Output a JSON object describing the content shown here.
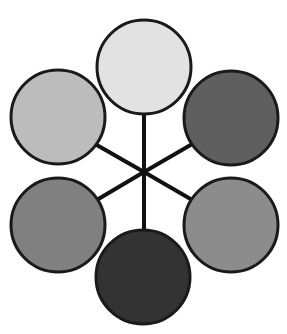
{
  "figure": {
    "width": 287,
    "height": 334,
    "background_color": "#ffffff"
  },
  "chart_data": {
    "type": "scatter",
    "subtitle": "",
    "xlabel": "",
    "ylabel": "",
    "grid": false,
    "legend_position": "none",
    "xlim": [
      0,
      287
    ],
    "ylim": [
      0,
      334
    ],
    "layout": "hexagonal rosette around a central hub",
    "hub": {
      "name": "center-hub",
      "x": 144,
      "y": 172,
      "visible_marker": false
    },
    "node_radius": 47,
    "node_outline_color": "#1a1a1a",
    "node_outline_width": 3,
    "spoke_color": "#111111",
    "spoke_width": 4,
    "categories": [
      "top",
      "upper-right",
      "lower-right",
      "bottom",
      "lower-left",
      "upper-left"
    ],
    "values": [
      226,
      95,
      140,
      51,
      128,
      188
    ],
    "series": [
      {
        "name": "node-fill-gray-level",
        "values": [
          226,
          95,
          140,
          51,
          128,
          188
        ]
      }
    ],
    "nodes": [
      {
        "id": "node-top",
        "label": "top",
        "angle_deg": 90,
        "cx": 144,
        "cy": 67,
        "r": 47,
        "fill": "#e2e2e2",
        "gray_level": 226,
        "stroke": "#1a1a1a"
      },
      {
        "id": "node-upper-right",
        "label": "upper-right",
        "angle_deg": 30,
        "cx": 231,
        "cy": 118,
        "r": 47,
        "fill": "#5f5f5f",
        "gray_level": 95,
        "stroke": "#1a1a1a"
      },
      {
        "id": "node-lower-right",
        "label": "lower-right",
        "angle_deg": -30,
        "cx": 231,
        "cy": 225,
        "r": 47,
        "fill": "#8c8c8c",
        "gray_level": 140,
        "stroke": "#1a1a1a"
      },
      {
        "id": "node-bottom",
        "label": "bottom",
        "angle_deg": -90,
        "cx": 143,
        "cy": 277,
        "r": 47,
        "fill": "#333333",
        "gray_level": 51,
        "stroke": "#1a1a1a"
      },
      {
        "id": "node-lower-left",
        "label": "lower-left",
        "angle_deg": 210,
        "cx": 58,
        "cy": 225,
        "r": 47,
        "fill": "#808080",
        "gray_level": 128,
        "stroke": "#1a1a1a"
      },
      {
        "id": "node-upper-left",
        "label": "upper-left",
        "angle_deg": 150,
        "cx": 58,
        "cy": 117,
        "r": 47,
        "fill": "#bcbcbc",
        "gray_level": 188,
        "stroke": "#1a1a1a"
      }
    ],
    "edges": [
      {
        "id": "spoke-top",
        "from": "center-hub",
        "to": "node-top",
        "x1": 144,
        "y1": 172,
        "x2": 144,
        "y2": 114
      },
      {
        "id": "spoke-upper-right",
        "from": "center-hub",
        "to": "node-upper-right",
        "x1": 144,
        "y1": 172,
        "x2": 194,
        "y2": 143
      },
      {
        "id": "spoke-lower-right",
        "from": "center-hub",
        "to": "node-lower-right",
        "x1": 144,
        "y1": 172,
        "x2": 194,
        "y2": 201
      },
      {
        "id": "spoke-bottom",
        "from": "center-hub",
        "to": "node-bottom",
        "x1": 144,
        "y1": 172,
        "x2": 144,
        "y2": 231
      },
      {
        "id": "spoke-lower-left",
        "from": "center-hub",
        "to": "node-lower-left",
        "x1": 144,
        "y1": 172,
        "x2": 95,
        "y2": 201
      },
      {
        "id": "spoke-upper-left",
        "from": "center-hub",
        "to": "node-upper-left",
        "x1": 144,
        "y1": 172,
        "x2": 95,
        "y2": 144
      }
    ]
  }
}
